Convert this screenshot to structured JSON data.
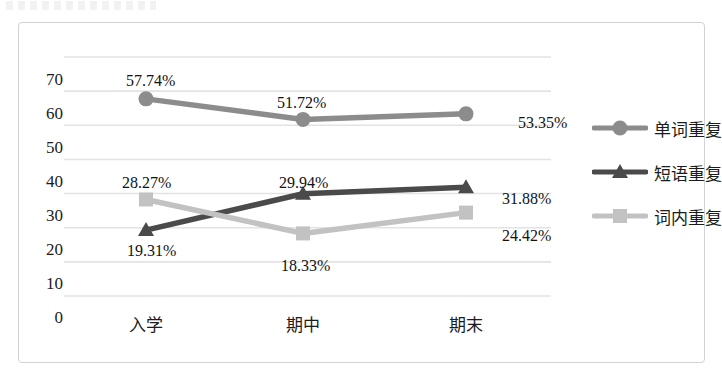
{
  "chart_data": {
    "type": "line",
    "title": "",
    "xlabel": "",
    "ylabel": "",
    "ylim": [
      0,
      70
    ],
    "ytick_step": 10,
    "ytick_labels": [
      "0",
      "10",
      "20",
      "30",
      "40",
      "50",
      "60",
      "70"
    ],
    "grid": true,
    "legend_position": "right",
    "categories": [
      "入学",
      "期中",
      "期末"
    ],
    "series": [
      {
        "name": "单词重复",
        "marker": "circle",
        "color": "#8c8c8c",
        "values": [
          57.74,
          51.72,
          53.35
        ],
        "labels": [
          "57.74%",
          "51.72%",
          "53.35%"
        ]
      },
      {
        "name": "短语重复",
        "marker": "triangle",
        "color": "#4a4a4a",
        "values": [
          19.31,
          29.94,
          31.88
        ],
        "labels": [
          "19.31%",
          "29.94%",
          "31.88%"
        ]
      },
      {
        "name": "词内重复",
        "marker": "square",
        "color": "#c2c2c2",
        "values": [
          28.27,
          18.33,
          24.42
        ],
        "labels": [
          "28.27%",
          "18.33%",
          "24.42%"
        ]
      }
    ]
  },
  "axis": {
    "y": [
      {
        "label": "70",
        "top": 48
      },
      {
        "label": "60",
        "top": 82
      },
      {
        "label": "50",
        "top": 116
      },
      {
        "label": "40",
        "top": 150
      },
      {
        "label": "30",
        "top": 184
      },
      {
        "label": "20",
        "top": 218
      },
      {
        "label": "10",
        "top": 252
      },
      {
        "label": "0",
        "top": 286
      }
    ],
    "x": [
      {
        "label": "入学",
        "left": 67
      },
      {
        "label": "期中",
        "left": 224
      },
      {
        "label": "期末",
        "left": 387
      }
    ]
  },
  "data_labels": [
    {
      "text": "57.74%",
      "left": 107,
      "top": 50
    },
    {
      "text": "51.72%",
      "left": 258,
      "top": 72
    },
    {
      "text": "53.35%",
      "left": 499,
      "top": 92
    },
    {
      "text": "28.27%",
      "left": 103,
      "top": 152
    },
    {
      "text": "29.94%",
      "left": 260,
      "top": 152
    },
    {
      "text": "31.88%",
      "left": 483,
      "top": 168
    },
    {
      "text": "19.31%",
      "left": 108,
      "top": 220
    },
    {
      "text": "18.33%",
      "left": 262,
      "top": 235
    },
    {
      "text": "24.42%",
      "left": 483,
      "top": 205
    }
  ],
  "legend": {
    "items": [
      {
        "label": "单词重复",
        "marker": "circle",
        "color": "#8c8c8c",
        "top": 92
      },
      {
        "label": "短语重复",
        "marker": "triangle",
        "color": "#4a4a4a",
        "top": 136
      },
      {
        "label": "词内重复",
        "marker": "square",
        "color": "#c2c2c2",
        "top": 180
      }
    ],
    "left": 573
  },
  "colors": {
    "grid": "#e3e3e3",
    "frame": "#d2d2d2",
    "text": "#1c1c1c",
    "background": "#ffffff"
  }
}
